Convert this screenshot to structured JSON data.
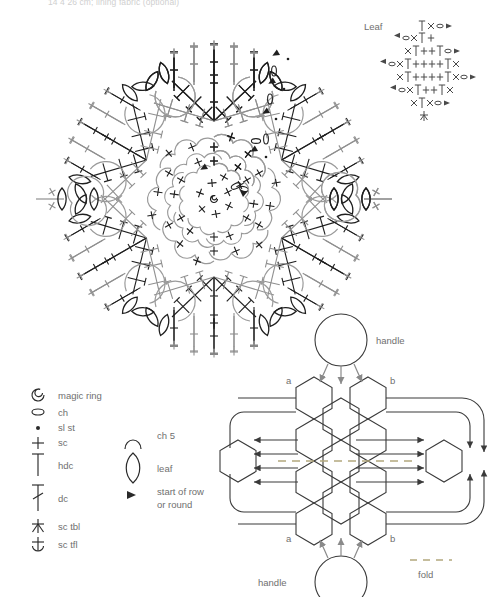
{
  "page": {
    "top_note": "14 4 26 cm; lining fabric (optional)",
    "background": "#ffffff",
    "ink_dark": "#1f1f1f",
    "ink_gray": "#7d7d7d",
    "ink_light": "#b9b9b9",
    "text_color": "#6f6f6f",
    "fold_color": "#b3a87e"
  },
  "leaf_chart": {
    "title": "Leaf",
    "rows": [
      {
        "row": 1,
        "symbols": [
          "hdc",
          "sc-x",
          "ch",
          "arrow"
        ]
      },
      {
        "row": 2,
        "symbols": [
          "arrow",
          "ch",
          "sc-x",
          "hdc",
          "sc"
        ]
      },
      {
        "row": 3,
        "symbols": [
          "sc-x",
          "hdc",
          "sc",
          "sc",
          "hdc",
          "ch",
          "arrow"
        ]
      },
      {
        "row": 4,
        "symbols": [
          "arrow",
          "ch",
          "sc-x",
          "hdc",
          "sc",
          "sc",
          "sc",
          "sc",
          "hdc",
          "sc-x"
        ]
      },
      {
        "row": 5,
        "symbols": [
          "sc-x",
          "hdc",
          "sc",
          "sc",
          "sc",
          "sc",
          "hdc",
          "sc-x",
          "ch",
          "arrow"
        ]
      },
      {
        "row": 6,
        "symbols": [
          "arrow",
          "ch",
          "sc-x",
          "hdc",
          "sc",
          "sc",
          "hdc",
          "sc-x"
        ]
      },
      {
        "row": 7,
        "symbols": [
          "sc-x",
          "hdc",
          "sc-x",
          "ch",
          "arrow"
        ]
      },
      {
        "row": 8,
        "symbols": [
          "sc-tbl"
        ]
      }
    ]
  },
  "legend": {
    "stitch_symbols": [
      {
        "symbol": "magic-ring",
        "label": "magic ring"
      },
      {
        "symbol": "ch",
        "label": "ch"
      },
      {
        "symbol": "sl-st",
        "label": "sl st"
      },
      {
        "symbol": "sc",
        "label": "sc"
      },
      {
        "symbol": "hdc",
        "label": "hdc"
      },
      {
        "symbol": "dc",
        "label": "dc"
      },
      {
        "symbol": "sc-tbl",
        "label": "sc tbl"
      },
      {
        "symbol": "sc-tfl",
        "label": "sc tfl"
      }
    ],
    "motif_symbols": [
      {
        "symbol": "arc",
        "label": "ch 5"
      },
      {
        "symbol": "leaf",
        "label": "leaf"
      },
      {
        "symbol": "triangle",
        "label": "start of row or round",
        "label_line1": "start of row",
        "label_line2": "or round"
      }
    ]
  },
  "assembly": {
    "handle_top": "handle",
    "handle_bottom": "handle",
    "fold_label": "fold",
    "corner_labels": {
      "top_left": "a",
      "top_right": "b",
      "bottom_left": "a",
      "bottom_right": "b"
    },
    "hex_count": 11,
    "handle_count": 2
  },
  "mandala": {
    "symmetry": 6,
    "rounds": 9,
    "leaf_motifs": 12,
    "center": "magic-ring"
  }
}
